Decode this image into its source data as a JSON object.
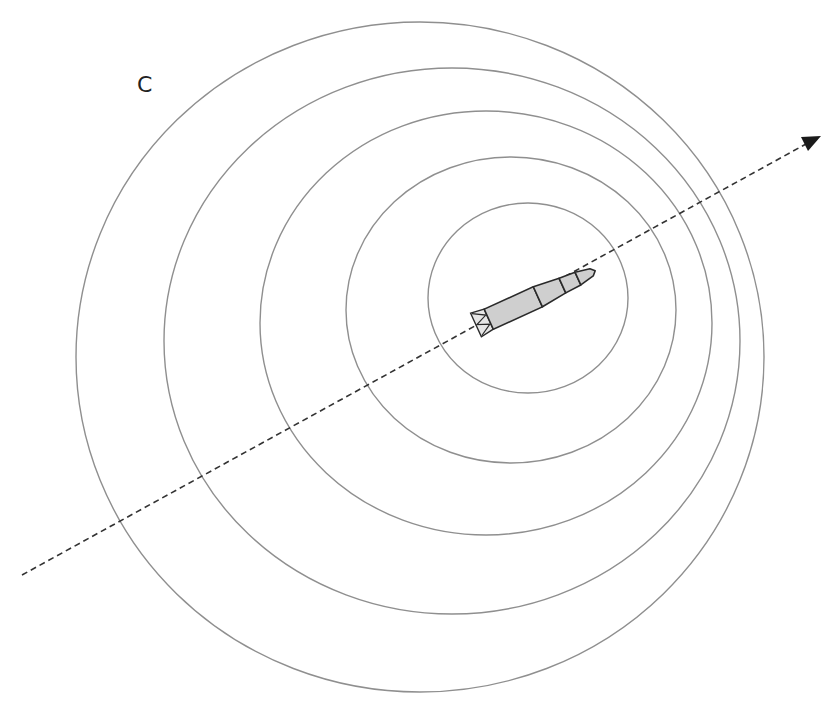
{
  "figure": {
    "label": "C",
    "colors": {
      "wavefront": "#8f8f8f",
      "trajectory": "#333333",
      "rocket_fill": "#cfcfcf",
      "rocket_outline": "#2a2a2a"
    },
    "wavefronts": [
      {
        "cx": 528,
        "cy": 298,
        "rx": 100,
        "ry": 95
      },
      {
        "cx": 511,
        "cy": 310,
        "rx": 165,
        "ry": 153
      },
      {
        "cx": 486,
        "cy": 323,
        "rx": 226,
        "ry": 212
      },
      {
        "cx": 452,
        "cy": 341,
        "rx": 288,
        "ry": 273
      },
      {
        "cx": 420,
        "cy": 357,
        "rx": 344,
        "ry": 335
      }
    ],
    "trajectory": {
      "x1": 22,
      "y1": 575,
      "x2": 808,
      "y2": 143,
      "arrow": "end"
    },
    "rocket": {
      "nose_x": 590,
      "nose_y": 263,
      "tail_x": 475,
      "tail_y": 325
    }
  }
}
